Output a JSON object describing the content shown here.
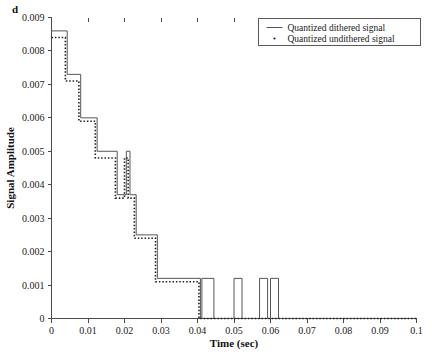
{
  "panel": {
    "label": "d"
  },
  "chart_data": {
    "type": "line",
    "title": "",
    "xlabel": "Time (sec)",
    "ylabel": "Signal Amplitude",
    "xlim": [
      0,
      0.1
    ],
    "ylim": [
      0,
      0.009
    ],
    "grid": false,
    "legend_position": "top-right",
    "xticks": [
      0,
      0.01,
      0.02,
      0.03,
      0.04,
      0.05,
      0.06,
      0.07,
      0.08,
      0.09,
      0.1
    ],
    "xticklabels": [
      "0",
      "0.01",
      "0.02",
      "0.03",
      "0.04",
      "0.05",
      "0.06",
      "0.07",
      "0.08",
      "0.09",
      "0.1"
    ],
    "yticks": [
      0,
      0.001,
      0.002,
      0.003,
      0.004,
      0.005,
      0.006,
      0.007,
      0.008,
      0.009
    ],
    "yticklabels": [
      "0",
      "0.001",
      "0.002",
      "0.003",
      "0.004",
      "0.005",
      "0.006",
      "0.007",
      "0.008",
      "0.009"
    ],
    "series": [
      {
        "name": "Quantized dithered signal",
        "style": "solid",
        "color": "#555555",
        "drawstyle": "steps-post",
        "x": [
          0.0,
          0.0043,
          0.0043,
          0.008,
          0.008,
          0.0125,
          0.0125,
          0.018,
          0.018,
          0.0205,
          0.0205,
          0.0215,
          0.0215,
          0.0232,
          0.0232,
          0.029,
          0.029,
          0.0408,
          0.0408,
          0.0412,
          0.0412,
          0.0445,
          0.0445,
          0.05,
          0.05,
          0.0522,
          0.0522,
          0.057,
          0.057,
          0.0592,
          0.0592,
          0.06,
          0.06,
          0.0622,
          0.0622,
          0.1
        ],
        "y": [
          0.0086,
          0.0086,
          0.0073,
          0.0073,
          0.006,
          0.006,
          0.005,
          0.005,
          0.0037,
          0.0037,
          0.005,
          0.005,
          0.0037,
          0.0037,
          0.0025,
          0.0025,
          0.0012,
          0.0012,
          0.0,
          0.0,
          0.0012,
          0.0012,
          0.0,
          0.0,
          0.0012,
          0.0012,
          0.0,
          0.0,
          0.0012,
          0.0012,
          0.0,
          0.0,
          0.0012,
          0.0012,
          0.0,
          0.0
        ]
      },
      {
        "name": "Quantized undithered signal",
        "style": "dotted",
        "color": "#222222",
        "drawstyle": "steps-post",
        "x": [
          0.0,
          0.0038,
          0.0038,
          0.0075,
          0.0075,
          0.012,
          0.012,
          0.0175,
          0.0175,
          0.02,
          0.02,
          0.021,
          0.021,
          0.0227,
          0.0227,
          0.0285,
          0.0285,
          0.0404,
          0.0404,
          0.1
        ],
        "y": [
          0.0084,
          0.0084,
          0.0071,
          0.0071,
          0.0059,
          0.0059,
          0.0048,
          0.0048,
          0.0036,
          0.0036,
          0.0048,
          0.0048,
          0.0036,
          0.0036,
          0.0024,
          0.0024,
          0.0011,
          0.0011,
          0.0,
          0.0
        ]
      }
    ],
    "legend": [
      {
        "label": "Quantized dithered signal",
        "marker": "line"
      },
      {
        "label": "Quantized undithered signal",
        "marker": "dot"
      }
    ]
  }
}
